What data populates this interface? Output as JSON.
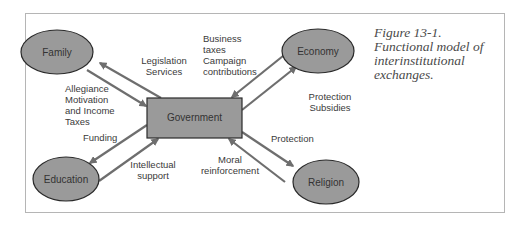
{
  "figure": {
    "caption_lines": [
      "Figure 13-1.",
      "Functional model of",
      "interinstitutional",
      "exchanges."
    ]
  },
  "nodes": {
    "family": "Family",
    "economy": "Economy",
    "education": "Education",
    "religion": "Religion",
    "government": "Government"
  },
  "edges": {
    "gov_to_family": [
      "Legislation",
      "Services"
    ],
    "family_to_gov": [
      "Allegiance",
      "Motivation",
      "and Income",
      "Taxes"
    ],
    "economy_to_gov": [
      "Business",
      "taxes",
      "Campaign",
      "contributions"
    ],
    "gov_to_economy": [
      "Protection",
      "Subsidies"
    ],
    "gov_to_education": [
      "Funding"
    ],
    "education_to_gov": [
      "Intellectual",
      "support"
    ],
    "gov_to_religion": [
      "Protection"
    ],
    "religion_to_gov": [
      "Moral",
      "reinforcement"
    ]
  },
  "colors": {
    "node_fill": "#9a9a9a",
    "node_stroke": "#2a2a2a",
    "arrow": "#6e6e6e",
    "frame": "#b5b5b5"
  }
}
